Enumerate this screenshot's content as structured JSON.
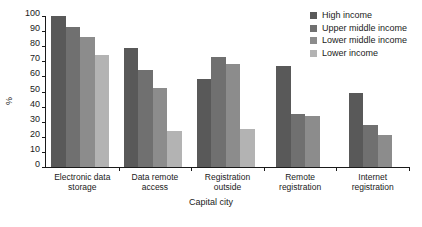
{
  "chart_data": {
    "type": "bar",
    "title": "",
    "xlabel": "Capital city",
    "ylabel": "%",
    "ylim": [
      0,
      100
    ],
    "ytick_step": 10,
    "yticks": [
      0,
      10,
      20,
      30,
      40,
      50,
      60,
      70,
      80,
      90,
      100
    ],
    "grid": false,
    "legend_position": "top-right",
    "categories": [
      "Electronic data storage",
      "Data remote access",
      "Registration outside",
      "Remote registration",
      "Internet registration"
    ],
    "category_lines": [
      [
        "Electronic data",
        "storage"
      ],
      [
        "Data remote",
        "access"
      ],
      [
        "Registration",
        "outside"
      ],
      [
        "Remote",
        "registration"
      ],
      [
        "Internet",
        "registration"
      ]
    ],
    "series": [
      {
        "name": "High income",
        "color": "#595959",
        "values": [
          100,
          79,
          58,
          67,
          49
        ]
      },
      {
        "name": "Upper middle income",
        "color": "#707070",
        "values": [
          93,
          64,
          73,
          35,
          28
        ]
      },
      {
        "name": "Lower middle income",
        "color": "#8c8c8c",
        "values": [
          86,
          52,
          68,
          34,
          21
        ]
      },
      {
        "name": "Lower income",
        "color": "#b3b3b3",
        "values": [
          74,
          24,
          25,
          null,
          null
        ]
      }
    ]
  },
  "legend": {
    "items": [
      {
        "label": "High income",
        "color": "#595959"
      },
      {
        "label": "Upper middle income",
        "color": "#707070"
      },
      {
        "label": "Lower middle income",
        "color": "#8c8c8c"
      },
      {
        "label": "Lower income",
        "color": "#b3b3b3"
      }
    ]
  }
}
